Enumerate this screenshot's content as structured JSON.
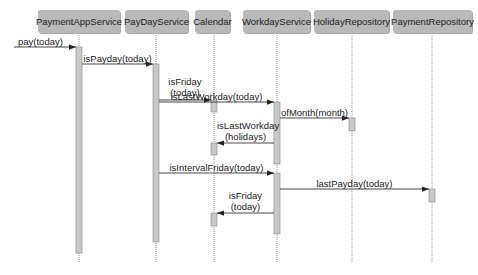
{
  "participants": [
    {
      "name": "PaymentAppService"
    },
    {
      "name": "PayDayService"
    },
    {
      "name": "Calendar"
    },
    {
      "name": "WorkdayService"
    },
    {
      "name": "HolidayRepository"
    },
    {
      "name": "PaymentRepository"
    }
  ],
  "messages": [
    {
      "label": "pay(today)",
      "from": "external",
      "to": "PaymentAppService"
    },
    {
      "label": "isPayday(today)",
      "from": "PaymentAppService",
      "to": "PayDayService"
    },
    {
      "label": "isFriday\n(today)",
      "from": "PayDayService",
      "to": "Calendar"
    },
    {
      "label": "isLastWorkday(today)",
      "from": "PayDayService",
      "to": "WorkdayService"
    },
    {
      "label": "ofMonth(month)",
      "from": "WorkdayService",
      "to": "HolidayRepository"
    },
    {
      "label": "isLastWorkday\n(holidays)",
      "from": "WorkdayService",
      "to": "Calendar"
    },
    {
      "label": "isIntervalFriday(today)",
      "from": "PayDayService",
      "to": "WorkdayService"
    },
    {
      "label": "lastPayday(today)",
      "from": "WorkdayService",
      "to": "PaymentRepository"
    },
    {
      "label": "isFriday\n(today)",
      "from": "WorkdayService",
      "to": "Calendar"
    }
  ],
  "colors": {
    "box": "#b9b9b9",
    "activation": "#c8c8c8",
    "line": "#333333"
  }
}
